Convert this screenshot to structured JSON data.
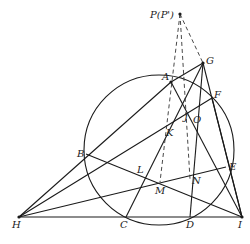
{
  "diagram": {
    "type": "geometry",
    "labels": {
      "P": "P(P')",
      "G": "G",
      "A": "A",
      "F": "F",
      "J": "J",
      "O": "O",
      "K": "K",
      "B": "B",
      "L": "L",
      "E": "E",
      "M": "M",
      "N": "N",
      "H": "H",
      "C": "C",
      "D": "D",
      "I": "I"
    },
    "points": {
      "P": [
        180,
        14
      ],
      "G": [
        203,
        63
      ],
      "A": [
        171,
        82
      ],
      "F": [
        212,
        98
      ],
      "J": [
        189,
        111
      ],
      "K": [
        166,
        129
      ],
      "B": [
        86,
        154
      ],
      "L": [
        141,
        170
      ],
      "E": [
        226,
        167
      ],
      "M": [
        160,
        182
      ],
      "N": [
        190,
        179
      ],
      "H": [
        19,
        217
      ],
      "C": [
        126,
        217
      ],
      "D": [
        190,
        217
      ],
      "I": [
        242,
        217
      ]
    },
    "circle": {
      "cx": 159,
      "cy": 150,
      "r": 75
    },
    "stroke_color": "#1a1a1a"
  }
}
